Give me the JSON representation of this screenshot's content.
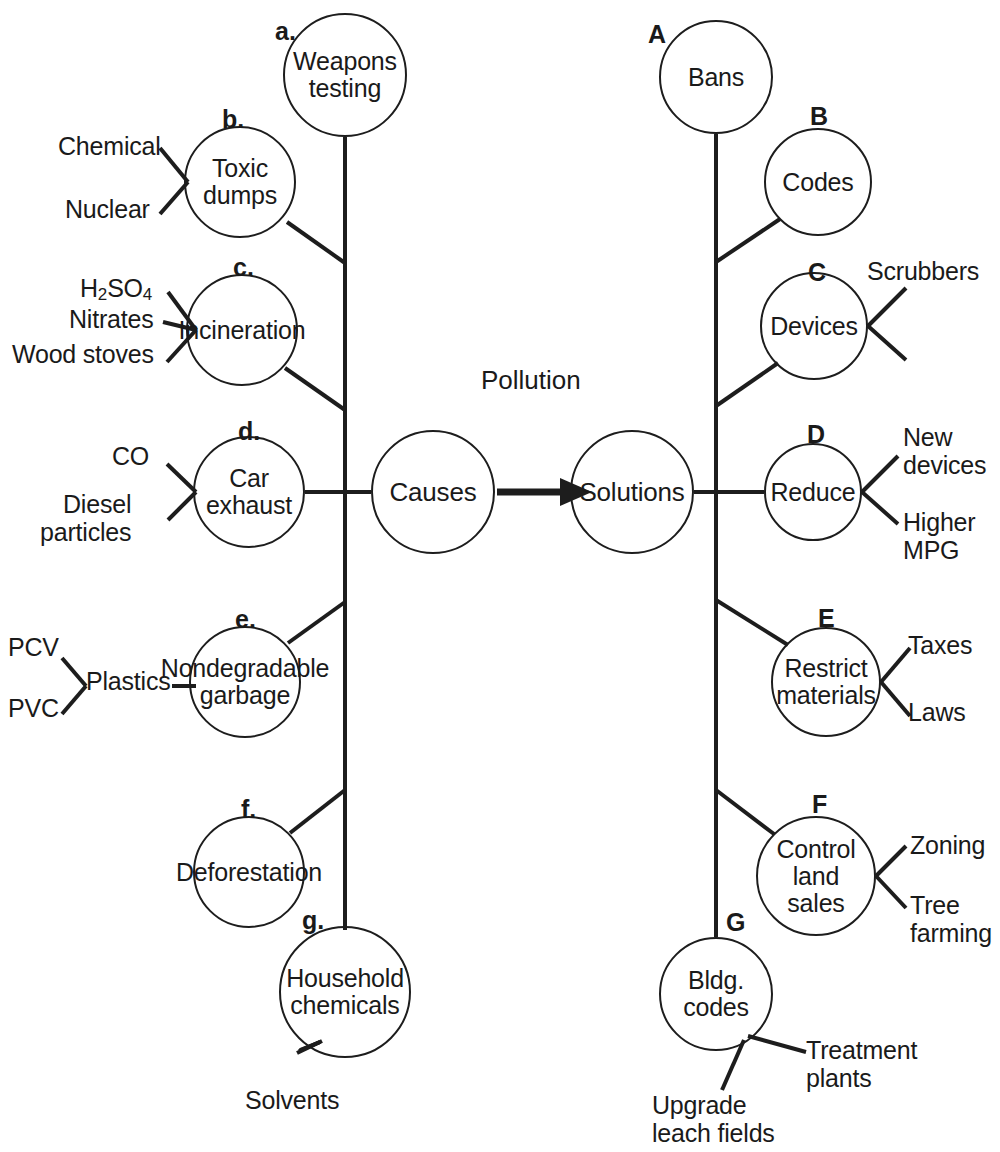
{
  "diagram": {
    "title": "Pollution",
    "type": "concept-map",
    "hubs": [
      {
        "id": "causes",
        "label": "Causes",
        "cx": 433,
        "cy": 492,
        "r": 62
      },
      {
        "id": "solutions",
        "label": "Solutions",
        "cx": 632,
        "cy": 492,
        "r": 62
      }
    ],
    "arrow": {
      "from": "causes",
      "to": "solutions",
      "x1": 497,
      "x2": 568,
      "y": 492
    },
    "causes": [
      {
        "tag": "a.",
        "label": "Weapons testing",
        "lines": [
          "Weapons",
          "testing"
        ],
        "cx": 345,
        "cy": 75,
        "r": 62,
        "leaves": []
      },
      {
        "tag": "b.",
        "label": "Toxic dumps",
        "lines": [
          "Toxic",
          "dumps"
        ],
        "cx": 240,
        "cy": 182,
        "r": 56,
        "leaves": [
          "Chemical",
          "Nuclear"
        ]
      },
      {
        "tag": "c.",
        "label": "Incineration",
        "lines": [
          "Incineration"
        ],
        "cx": 242,
        "cy": 330,
        "r": 56,
        "leaves": [
          "H2SO4",
          "Nitrates",
          "Wood stoves"
        ]
      },
      {
        "tag": "d.",
        "label": "Car exhaust",
        "lines": [
          "Car",
          "exhaust"
        ],
        "cx": 249,
        "cy": 492,
        "r": 56,
        "leaves": [
          "CO",
          "Diesel particles"
        ]
      },
      {
        "tag": "e.",
        "label": "Nondegradable garbage",
        "lines": [
          "Nondegradable",
          "garbage"
        ],
        "cx": 245,
        "cy": 682,
        "r": 56,
        "leaves": [
          "Plastics",
          "PCV",
          "PVC"
        ]
      },
      {
        "tag": "f.",
        "label": "Deforestation",
        "lines": [
          "Deforestation"
        ],
        "cx": 249,
        "cy": 872,
        "r": 56,
        "leaves": []
      },
      {
        "tag": "g.",
        "label": "Household chemicals",
        "lines": [
          "Household",
          "chemicals"
        ],
        "cx": 345,
        "cy": 992,
        "r": 66,
        "leaves": [
          "Solvents"
        ]
      }
    ],
    "solutions": [
      {
        "tag": "A",
        "label": "Bans",
        "lines": [
          "Bans"
        ],
        "cx": 716,
        "cy": 77,
        "r": 57,
        "leaves": []
      },
      {
        "tag": "B",
        "label": "Codes",
        "lines": [
          "Codes"
        ],
        "cx": 818,
        "cy": 182,
        "r": 54,
        "leaves": []
      },
      {
        "tag": "C",
        "label": "Devices",
        "lines": [
          "Devices"
        ],
        "cx": 814,
        "cy": 326,
        "r": 54,
        "leaves": [
          "Scrubbers"
        ]
      },
      {
        "tag": "D",
        "label": "Reduce",
        "lines": [
          "Reduce"
        ],
        "cx": 813,
        "cy": 492,
        "r": 49,
        "leaves": [
          "New devices",
          "Higher MPG"
        ]
      },
      {
        "tag": "E",
        "label": "Restrict materials",
        "lines": [
          "Restrict",
          "materials"
        ],
        "cx": 826,
        "cy": 682,
        "r": 55,
        "leaves": [
          "Taxes",
          "Laws"
        ]
      },
      {
        "tag": "F",
        "label": "Control land sales",
        "lines": [
          "Control",
          "land",
          "sales"
        ],
        "cx": 816,
        "cy": 876,
        "r": 60,
        "leaves": [
          "Zoning",
          "Tree farming"
        ]
      },
      {
        "tag": "G",
        "label": "Bldg. codes",
        "lines": [
          "Bldg.",
          "codes"
        ],
        "cx": 716,
        "cy": 994,
        "r": 57,
        "leaves": [
          "Treatment plants",
          "Upgrade leach fields"
        ]
      }
    ],
    "leaf_text": {
      "chemical": "Chemical",
      "nuclear": "Nuclear",
      "h2so4_pre": "H",
      "h2so4_sub1": "2",
      "h2so4_mid": "SO",
      "h2so4_sub2": "4",
      "nitrates": "Nitrates",
      "wood_stoves": "Wood stoves",
      "co": "CO",
      "diesel_line1": "Diesel",
      "diesel_line2": "particles",
      "pcv": "PCV",
      "pvc": "PVC",
      "plastics": "Plastics",
      "solvents": "Solvents",
      "scrubbers": "Scrubbers",
      "new_line1": "New",
      "new_line2": "devices",
      "higher_line1": "Higher",
      "higher_line2": "MPG",
      "taxes": "Taxes",
      "laws": "Laws",
      "zoning": "Zoning",
      "tree_line1": "Tree",
      "tree_line2": "farming",
      "treatment_line1": "Treatment",
      "treatment_line2": "plants",
      "upgrade_line1": "Upgrade",
      "upgrade_line2": "leach fields"
    },
    "colors": {
      "stroke": "#1d1d1d",
      "text": "#1a1a1a",
      "background": "#ffffff"
    }
  }
}
